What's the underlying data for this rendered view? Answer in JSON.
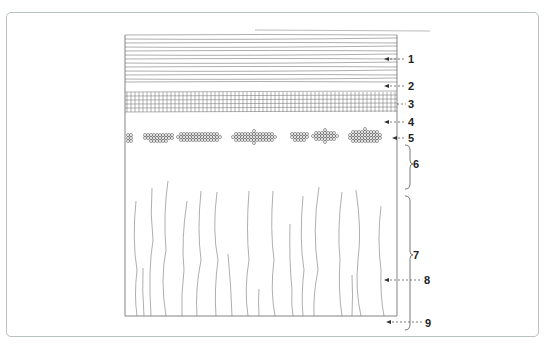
{
  "figure": {
    "title": "",
    "type": "schematic cross-section of layered tissue",
    "frame_border_color": "#b9c2bf",
    "line_color": "#555555",
    "labels": [
      {
        "id": "1",
        "text": "1",
        "target": "horizontal-lines-layer"
      },
      {
        "id": "2",
        "text": "2",
        "target": "clear-band-below-lines"
      },
      {
        "id": "3",
        "text": "3",
        "target": "grid-layer"
      },
      {
        "id": "4",
        "text": "4",
        "target": "clear-band-below-grid"
      },
      {
        "id": "5",
        "text": "5",
        "target": "cell-cluster-row"
      },
      {
        "id": "6",
        "text": "6",
        "target": "clear-zone-bracket"
      },
      {
        "id": "7",
        "text": "7",
        "target": "fiber-zone-bracket"
      },
      {
        "id": "8",
        "text": "8",
        "target": "vertical-fiber"
      },
      {
        "id": "9",
        "text": "9",
        "target": "base-line"
      }
    ]
  }
}
